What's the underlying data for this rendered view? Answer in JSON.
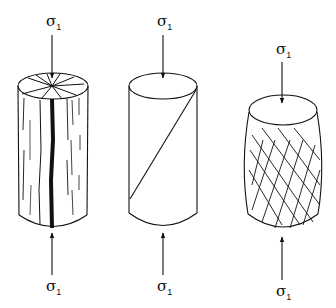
{
  "figure": {
    "specimens": [
      {
        "name": "axial-splitting",
        "top_label": "σ",
        "top_sub": "1",
        "bottom_label": "σ",
        "bottom_sub": "1",
        "fracture": "longitudinal splitting fractures"
      },
      {
        "name": "shear-fracture",
        "top_label": "σ",
        "top_sub": "1",
        "bottom_label": "σ",
        "bottom_sub": "1",
        "fracture": "single inclined shear plane"
      },
      {
        "name": "ductile-barrel",
        "top_label": "σ",
        "top_sub": "1",
        "bottom_label": "σ",
        "bottom_sub": "1",
        "fracture": "conjugate shear network, barreling"
      }
    ],
    "colors": {
      "ink": "#111111",
      "background": "#ffffff"
    }
  }
}
